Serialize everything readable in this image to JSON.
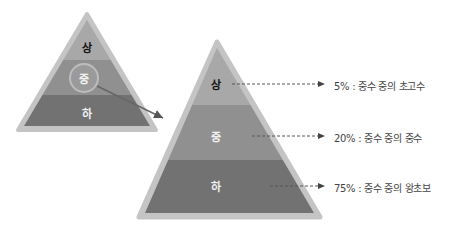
{
  "small_pyramid": {
    "tiers": [
      "상",
      "중",
      "하"
    ]
  },
  "large_pyramid": {
    "tiers": [
      "상",
      "중",
      "하"
    ]
  },
  "annotations": [
    "5% : 중수 중의 초고수",
    "20% : 중수 중의 중수",
    "75% : 중수 중의 왕초보"
  ],
  "colors": {
    "top": "#a9a9a9",
    "middle": "#8f8f8f",
    "bottom": "#6f6f6f",
    "border": "#bdbdbd"
  }
}
